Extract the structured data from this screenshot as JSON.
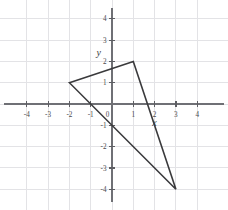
{
  "figure": {
    "title": "",
    "background_color": "#ffffff"
  },
  "axes": {
    "x_name": "x",
    "y_name": "y",
    "grid_color": "#e3e3e6",
    "axis_color": "#6f7075",
    "label_color": "#4a4a4d"
  },
  "chart_data": {
    "type": "scatter",
    "title": "",
    "xlabel": "x",
    "ylabel": "y",
    "xlim": [
      -4.6,
      4.6
    ],
    "ylim": [
      -4.6,
      4.6
    ],
    "grid": true,
    "grid_step": 1,
    "legend": "none",
    "x_tick_labels": [
      "-4",
      "-3",
      "-2",
      "-1",
      "0",
      "1",
      "2",
      "3",
      "4"
    ],
    "x_tick_values": [
      -4,
      -3,
      -2,
      -1,
      0,
      1,
      2,
      3,
      4
    ],
    "y_tick_labels": [
      "-4",
      "-3",
      "-2",
      "-1",
      "1",
      "2",
      "3",
      "4"
    ],
    "y_tick_values": [
      -4,
      -3,
      -2,
      -1,
      1,
      2,
      3,
      4
    ],
    "series": [
      {
        "name": "triangle",
        "kind": "polygon",
        "closed": true,
        "stroke": "#3a3a3c",
        "fill": "none",
        "points": [
          {
            "label": "A",
            "x": -2,
            "y": 1
          },
          {
            "label": "B",
            "x": 1,
            "y": 2
          },
          {
            "label": "C",
            "x": 3,
            "y": -4
          }
        ]
      }
    ],
    "annotations": [
      {
        "text": "y",
        "x": -0.62,
        "y": 2.25,
        "style": "italic"
      },
      {
        "text": "x",
        "x": 2.0,
        "y": -1.02,
        "style": "italic"
      }
    ]
  }
}
